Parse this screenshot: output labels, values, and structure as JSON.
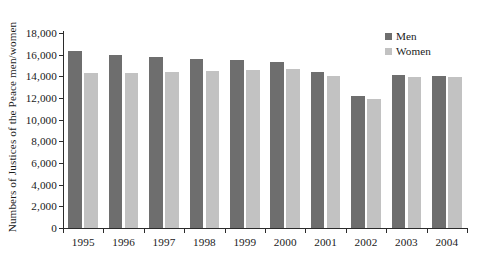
{
  "chart_data": {
    "type": "bar",
    "title": "",
    "xlabel": "",
    "ylabel": "Numbers of Justices of the Peace men/women",
    "categories": [
      "1995",
      "1996",
      "1997",
      "1998",
      "1999",
      "2000",
      "2001",
      "2002",
      "2003",
      "2004"
    ],
    "series": [
      {
        "name": "Men",
        "color": "#6e6e6e",
        "values": [
          16300,
          16000,
          15800,
          15600,
          15500,
          15300,
          14400,
          12200,
          14100,
          14000
        ]
      },
      {
        "name": "Women",
        "color": "#c2c2c2",
        "values": [
          14300,
          14300,
          14400,
          14500,
          14600,
          14700,
          14000,
          11900,
          13900,
          13900
        ]
      }
    ],
    "ylim": [
      0,
      18000
    ],
    "ytick_labels": [
      "0",
      "2,000",
      "4,000",
      "6,000",
      "8,000",
      "10,000",
      "12,000",
      "14,000",
      "16,000",
      "18,000"
    ],
    "ytick_values": [
      0,
      2000,
      4000,
      6000,
      8000,
      10000,
      12000,
      14000,
      16000,
      18000
    ],
    "grid": false,
    "legend_position": "top-right"
  },
  "legend": {
    "entries": [
      {
        "label": "Men"
      },
      {
        "label": "Women"
      }
    ]
  }
}
